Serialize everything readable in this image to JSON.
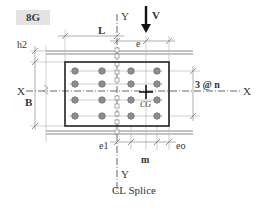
{
  "badge": {
    "label": "8G",
    "background": "#e3e3e3"
  },
  "labels": {
    "y_top": "Y",
    "y_bottom": "Y",
    "x_left": "X",
    "x_right": "X",
    "load": "V",
    "length": "L",
    "eccentricity": "e",
    "h2": "h2",
    "width": "B",
    "bolt_rows": "3 @ n",
    "cg": "CG",
    "e1": "e1",
    "pitch": "m",
    "eo": "eo",
    "splice": "CL Splice"
  },
  "geometry": {
    "bolt_columns": 4,
    "bolt_rows": 4,
    "bolt_color": "#8c8c8c",
    "plate_color": "#222222",
    "line_color": "#888888"
  }
}
